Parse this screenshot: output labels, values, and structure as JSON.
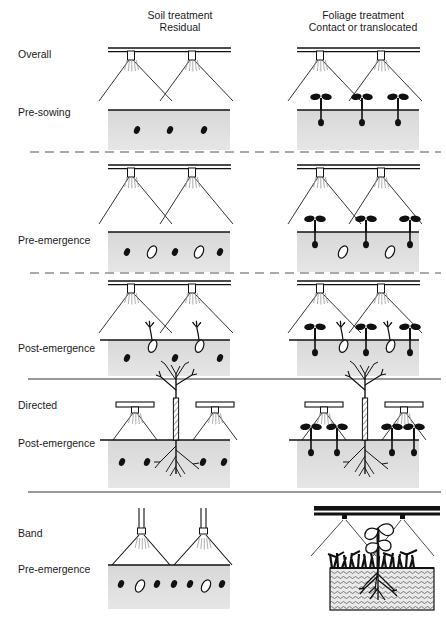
{
  "figure": {
    "title_columns": [
      {
        "line1": "Soil treatment",
        "line2": "Residual",
        "x": 180
      },
      {
        "line1": "Foliage treatment",
        "line2": "Contact or translocated",
        "x": 363
      }
    ],
    "row_labels": [
      {
        "text": "Overall",
        "x": 18,
        "y": 58
      },
      {
        "text": "Pre-sowing",
        "x": 18,
        "y": 116
      },
      {
        "text": "Pre-emergence",
        "x": 18,
        "y": 244
      },
      {
        "text": "Post-emergence",
        "x": 18,
        "y": 352
      },
      {
        "text": "Directed",
        "x": 18,
        "y": 409
      },
      {
        "text": "Post-emergence",
        "x": 18,
        "y": 447
      },
      {
        "text": "Band",
        "x": 18,
        "y": 537
      },
      {
        "text": "Pre-emergence",
        "x": 18,
        "y": 573
      }
    ],
    "separators": [
      {
        "kind": "dashed",
        "y": 152,
        "x1": 30,
        "x2": 441
      },
      {
        "kind": "dashed",
        "y": 273,
        "x1": 30,
        "x2": 441
      },
      {
        "kind": "solid",
        "y": 379,
        "x1": 28,
        "x2": 441
      },
      {
        "kind": "solid",
        "y": 492,
        "x1": 28,
        "x2": 441
      }
    ],
    "colors": {
      "ink": "#111111",
      "soil_fill": "#dcdcdc",
      "soil_fill_dark": "#c9c9c9",
      "spray_line": "#333333",
      "mist": "#9a9a9a",
      "paper": "#ffffff"
    },
    "legend_semantics": {
      "black_dot": "weed seed",
      "open_oval": "crop seed",
      "dark_seedling": "weed seedling",
      "open_seedling": "crop seedling",
      "hatched_stem_plant": "established crop plant",
      "grass_tufts": "emerged weeds"
    },
    "panels": [
      {
        "id": "overall-pre-sowing-soil",
        "row": "Overall / Pre-sowing",
        "column": "Soil treatment - Residual",
        "boom": "full-width double bar",
        "nozzles": 2,
        "spray": "overlapping wide cones",
        "soil_band": {
          "x": 108,
          "y": 110,
          "w": 122,
          "h": 40
        },
        "weed_seeds": 3,
        "crop_seeds": 0,
        "seedlings": 0
      },
      {
        "id": "overall-pre-sowing-foliage",
        "row": "Overall / Pre-sowing",
        "column": "Foliage treatment - Contact or translocated",
        "boom": "full-width double bar",
        "nozzles": 2,
        "spray": "overlapping wide cones",
        "soil_band": {
          "x": 297,
          "y": 110,
          "w": 122,
          "h": 40
        },
        "weed_seeds": 0,
        "crop_seeds": 0,
        "seedlings": 3,
        "seedling_type": "weed seedling (dark cotyledons)"
      },
      {
        "id": "pre-emergence-soil",
        "row": "Pre-emergence",
        "column": "Soil treatment - Residual",
        "boom": "full-width double bar",
        "nozzles": 2,
        "spray": "overlapping wide cones",
        "soil_band": {
          "x": 108,
          "y": 232,
          "w": 122,
          "h": 40
        },
        "weed_seeds": 3,
        "crop_seeds": 2,
        "seedlings": 0
      },
      {
        "id": "pre-emergence-foliage",
        "row": "Pre-emergence",
        "column": "Foliage treatment - Contact or translocated",
        "boom": "full-width double bar",
        "nozzles": 2,
        "spray": "overlapping wide cones",
        "soil_band": {
          "x": 297,
          "y": 232,
          "w": 122,
          "h": 40
        },
        "weed_seeds": 0,
        "crop_seeds": 2,
        "seedlings": 3,
        "seedling_type": "weed seedling (dark cotyledons)"
      },
      {
        "id": "post-emergence-soil",
        "row": "Post-emergence",
        "column": "Soil treatment - Residual",
        "boom": "full-width double bar",
        "nozzles": 2,
        "spray": "overlapping wide cones",
        "soil_band": {
          "x": 108,
          "y": 340,
          "w": 122,
          "h": 36
        },
        "weed_seeds": 3,
        "crop_seeds": 2,
        "crop_seedlings_emerged": 2
      },
      {
        "id": "post-emergence-foliage",
        "row": "Post-emergence",
        "column": "Foliage treatment - Contact or translocated",
        "boom": "full-width double bar",
        "nozzles": 2,
        "spray": "overlapping wide cones",
        "soil_band": {
          "x": 297,
          "y": 340,
          "w": 122,
          "h": 36
        },
        "weed_seedlings": 3,
        "crop_seedlings_emerged": 2
      },
      {
        "id": "directed-post-emergence-soil",
        "row": "Directed / Post-emergence",
        "column": "Soil treatment - Residual",
        "boom": "two low directed hoods",
        "nozzles": 2,
        "spray": "narrow downward cones aimed between rows",
        "soil_band": {
          "x": 108,
          "y": 440,
          "w": 122,
          "h": 48
        },
        "crop_plant": "established plant, hatched stem, branches, roots",
        "weed_seeds": 4
      },
      {
        "id": "directed-post-emergence-foliage",
        "row": "Directed / Post-emergence",
        "column": "Foliage treatment - Contact or translocated",
        "boom": "two low directed hoods",
        "nozzles": 2,
        "spray": "narrow downward cones aimed between rows",
        "soil_band": {
          "x": 297,
          "y": 440,
          "w": 122,
          "h": 48
        },
        "crop_plant": "established plant, hatched stem, branches, roots",
        "weed_seedlings": 4
      },
      {
        "id": "band-pre-emergence-soil",
        "row": "Band / Pre-emergence",
        "column": "Soil treatment - Residual",
        "boom": "two vertical drop pipes",
        "nozzles": 2,
        "spray": "narrow bands over the rows",
        "soil_band": {
          "x": 108,
          "y": 565,
          "w": 122,
          "h": 44
        },
        "weed_seeds": 6,
        "crop_seeds": 2
      },
      {
        "id": "band-pre-emergence-foliage",
        "row": "Band / Pre-emergence",
        "column": "Foliage treatment - Contact or translocated",
        "boom": "solid black bar with two point nozzles",
        "nozzles": 2,
        "spray": "converging fine jets onto one plant",
        "soil_band": {
          "x": 330,
          "y": 568,
          "w": 104,
          "h": 42,
          "texture": "stippled/hatched"
        },
        "crop_plant": "broadleaf seedling with open leaves and roots",
        "weed_cover": "dense black grass tufts across soil surface"
      }
    ]
  }
}
